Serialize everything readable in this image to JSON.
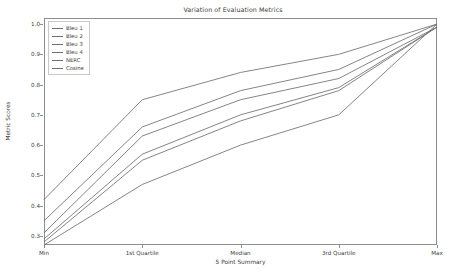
{
  "chart_data": {
    "type": "line",
    "title": "Variation of Evaluation Metrics",
    "xlabel": "5 Point Summary",
    "ylabel": "Metric Scores",
    "categories": [
      "Min",
      "1st Quartile",
      "Median",
      "3rd Quartile",
      "Max"
    ],
    "xtick_labels": [
      "Min",
      "1st Quartile",
      "Median",
      "3rd Quartile",
      "Max"
    ],
    "ytick_labels": [
      "0.3",
      "0.4",
      "0.5",
      "0.6",
      "0.7",
      "0.8",
      "0.9",
      "1.0"
    ],
    "ytick_values": [
      0.3,
      0.4,
      0.5,
      0.6,
      0.7,
      0.8,
      0.9,
      1.0
    ],
    "ylim": [
      0.27,
      1.02
    ],
    "grid": false,
    "legend_position": "upper left",
    "series": [
      {
        "name": "Bleu 1",
        "values": [
          0.42,
          0.75,
          0.84,
          0.9,
          1.0
        ],
        "color": "#6f6f6f"
      },
      {
        "name": "Bleu 2",
        "values": [
          0.35,
          0.66,
          0.78,
          0.85,
          1.0
        ],
        "color": "#6f6f6f"
      },
      {
        "name": "Bleu 3",
        "values": [
          0.31,
          0.63,
          0.75,
          0.82,
          0.99
        ],
        "color": "#6f6f6f"
      },
      {
        "name": "Bleu 4",
        "values": [
          0.29,
          0.57,
          0.7,
          0.79,
          0.99
        ],
        "color": "#6f6f6f"
      },
      {
        "name": "NERC",
        "values": [
          0.28,
          0.55,
          0.68,
          0.78,
          0.99
        ],
        "color": "#6f6f6f"
      },
      {
        "name": "Cosine",
        "values": [
          0.27,
          0.47,
          0.6,
          0.7,
          1.0
        ],
        "color": "#6f6f6f"
      }
    ]
  },
  "legend": {
    "items": [
      {
        "label": "Bleu 1"
      },
      {
        "label": "Bleu 2"
      },
      {
        "label": "Bleu 3"
      },
      {
        "label": "Bleu 4"
      },
      {
        "label": "NERC"
      },
      {
        "label": "Cosine"
      }
    ]
  },
  "colors": {
    "axis": "#8d8d8d",
    "text": "#3c3c3c",
    "line": "#6f6f6f",
    "background": "#ffffff"
  }
}
